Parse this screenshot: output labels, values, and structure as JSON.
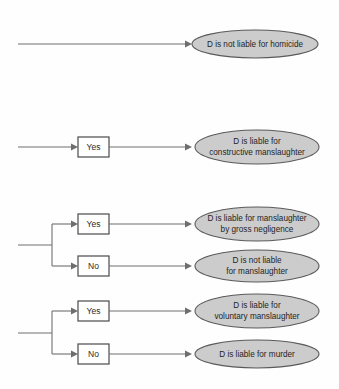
{
  "diagram": {
    "type": "flowchart",
    "background_color": "#fefefe",
    "outcome_fill_color": "#cccccc",
    "outcome_stroke_color": "#5a5a5a",
    "decision_box_fill_color": "#ffffff",
    "decision_box_stroke_color": "#4a4a4a",
    "line_color": "#6e6e6e",
    "branches": [
      {
        "id": "branch-1",
        "decision_labels": [],
        "outcomes": [
          {
            "id": "outcome-not-liable-homicide",
            "lines": [
              "D is not liable for homicide"
            ]
          }
        ]
      },
      {
        "id": "branch-2",
        "decision_labels": [
          "Yes"
        ],
        "outcomes": [
          {
            "id": "outcome-constructive-manslaughter",
            "lines": [
              "D is liable for",
              "constructive manslaughter"
            ]
          }
        ]
      },
      {
        "id": "branch-3",
        "decision_labels": [
          "Yes",
          "No"
        ],
        "outcomes": [
          {
            "id": "outcome-gross-negligence",
            "lines": [
              "D is liable for manslaughter",
              "by gross negligence"
            ]
          },
          {
            "id": "outcome-not-liable-manslaughter",
            "lines": [
              "D is not liable",
              "for manslaughter"
            ]
          }
        ]
      },
      {
        "id": "branch-4",
        "decision_labels": [
          "Yes",
          "No"
        ],
        "outcomes": [
          {
            "id": "outcome-voluntary-manslaughter",
            "lines": [
              "D is liable for",
              "voluntary manslaughter"
            ]
          },
          {
            "id": "outcome-murder",
            "lines": [
              "D is liable for murder"
            ]
          }
        ]
      }
    ],
    "nodes": {
      "yes_1": "Yes",
      "yes_2": "Yes",
      "no_2": "No",
      "yes_3": "Yes",
      "no_3": "No"
    },
    "outcome_text": {
      "row1_line1": "D is not liable for homicide",
      "row2_line1": "D is liable for",
      "row2_line2": "constructive manslaughter",
      "row3a_line1": "D is liable for manslaughter",
      "row3a_line2": "by gross negligence",
      "row3b_line1": "D is not liable",
      "row3b_line2": "for manslaughter",
      "row4a_line1": "D is liable for",
      "row4a_line2": "voluntary manslaughter",
      "row4b_line1": "D is liable for murder"
    }
  }
}
